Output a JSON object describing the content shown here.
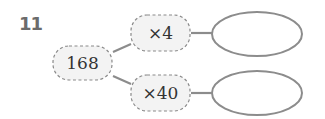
{
  "problem": {
    "number": "11",
    "start": {
      "value": "168"
    },
    "operations": [
      {
        "label": "×4",
        "answer": ""
      },
      {
        "label": "×40",
        "answer": ""
      }
    ]
  },
  "colors": {
    "line": "#8c8c8c",
    "dashed_border": "#8a8a8a",
    "box_fill": "#f3f3f3",
    "text": "#333333",
    "number": "#6b6b6b"
  }
}
